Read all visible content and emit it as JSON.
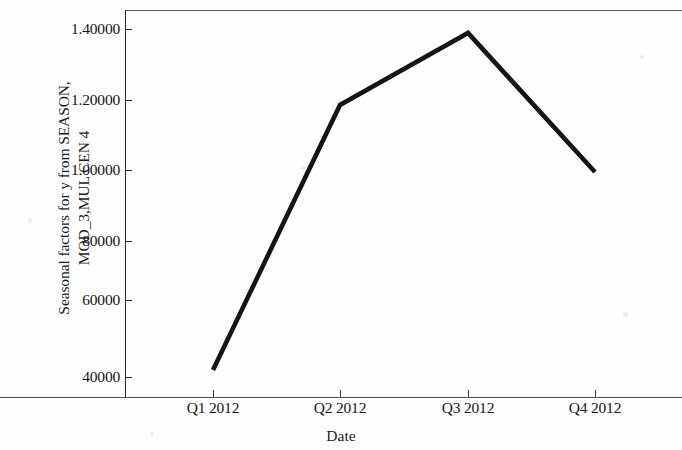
{
  "chart_data": {
    "type": "line",
    "title": "",
    "xlabel": "Date",
    "ylabel": "Seasonal factors for y from SEASON, MOD_3,MUL CEN 4",
    "ylabel_lines": [
      "Seasonal factors for y from SEASON,",
      "MOD_3,MUL CEN 4"
    ],
    "categories": [
      "Q1 2012",
      "Q2 2012",
      "Q3 2012",
      "Q4 2012"
    ],
    "values": [
      0.44,
      1.18,
      1.383,
      0.995
    ],
    "value_labels": [
      "0.44000",
      "1.18000",
      "1.38300",
      "0.99500"
    ],
    "ytick_labels": [
      "1.40000",
      "1.20000",
      "1.00000",
      "80000",
      "60000",
      "40000"
    ],
    "ytick_values": [
      1.4,
      1.2,
      1.0,
      0.8,
      0.6,
      0.4
    ],
    "ylim": [
      0.34,
      1.45
    ],
    "grid": false,
    "legend": "none",
    "series": [
      {
        "name": "Seasonal factors",
        "values": [
          0.44,
          1.18,
          1.383,
          0.995
        ],
        "color": "#151515"
      }
    ]
  },
  "axes": {
    "y_title_line1": "Seasonal factors for y from SEASON,",
    "y_title_line2": "MOD_3,MUL CEN 4",
    "x_title": "Date",
    "y_ticks": [
      {
        "label": "1.40000",
        "top": 29
      },
      {
        "label": "1.20000",
        "top": 100
      },
      {
        "label": "1.00000",
        "top": 170
      },
      {
        "label": "80000",
        "top": 241
      },
      {
        "label": "60000",
        "top": 300
      },
      {
        "label": "40000",
        "top": 377
      }
    ],
    "x_ticks": [
      {
        "label": "Q1 2012",
        "left": 213
      },
      {
        "label": "Q2 2012",
        "left": 340
      },
      {
        "label": "Q3 2012",
        "left": 468
      },
      {
        "label": "Q4 2012",
        "left": 595
      }
    ]
  },
  "line": {
    "color": "#151515",
    "width": 4.6,
    "points": "213,370 340,105 468,33 595,172"
  }
}
